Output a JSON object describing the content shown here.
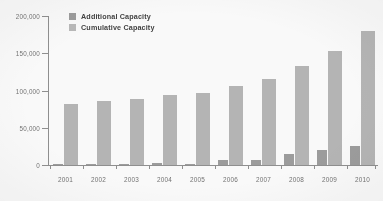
{
  "chart_data": {
    "type": "bar",
    "title": "",
    "subtitle": "",
    "xlabel": "",
    "ylabel": "",
    "categories": [
      "2001",
      "2002",
      "2003",
      "2004",
      "2005",
      "2006",
      "2007",
      "2008",
      "2009",
      "2010"
    ],
    "series": [
      {
        "name": "Additional Capacity",
        "color": "#9b9b9b",
        "values": [
          900,
          1100,
          1300,
          2400,
          1400,
          6200,
          7300,
          15300,
          19600,
          25000
        ]
      },
      {
        "name": "Cumulative Capacity",
        "color": "#b4b4b4",
        "values": [
          82000,
          86000,
          89000,
          94000,
          97000,
          106000,
          116000,
          133000,
          153000,
          180000
        ]
      }
    ],
    "ylim": [
      0,
      200000
    ],
    "yticks": [
      0,
      50000,
      100000,
      150000,
      200000
    ],
    "ytick_labels": [
      "0",
      "50,000",
      "100,000",
      "150,000",
      "200,000"
    ],
    "grid": false,
    "legend_position": "top-left"
  },
  "legend": {
    "items": [
      {
        "label": "Additional Capacity",
        "swatch": "legend-swatch-additional"
      },
      {
        "label": "Cumulative Capacity",
        "swatch": "legend-swatch-cumulative"
      }
    ]
  },
  "colors": {
    "additional": "#9b9b9b",
    "cumulative": "#b4b4b4",
    "axis": "#8d8d8d",
    "tick_text": "#6f6f6f",
    "legend_text": "#3a3a3a",
    "background": "#fdfdfd"
  }
}
